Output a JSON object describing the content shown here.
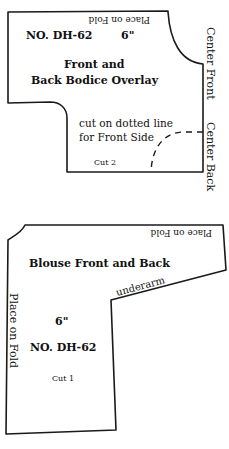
{
  "piece1": {
    "fold_label": "Place on Fold",
    "pattern_no": "NO. DH-62",
    "size": "6\"",
    "title_line1": "Front and",
    "title_line2": "Back Bodice Overlay",
    "center_front": "Center Front",
    "center_back": "Center Back",
    "note_line1": "cut on dotted line",
    "note_line2": "for Front Side",
    "cut": "Cut 2"
  },
  "piece2": {
    "fold_top_label": "Place on Fold",
    "title": "Blouse Front and Back",
    "underarm": "underarm",
    "fold_side_label": "Place on Fold",
    "size": "6\"",
    "pattern_no": "NO. DH-62",
    "cut": "Cut 1"
  },
  "colors": {
    "line": "#1a1a1a",
    "background": "#ffffff"
  }
}
